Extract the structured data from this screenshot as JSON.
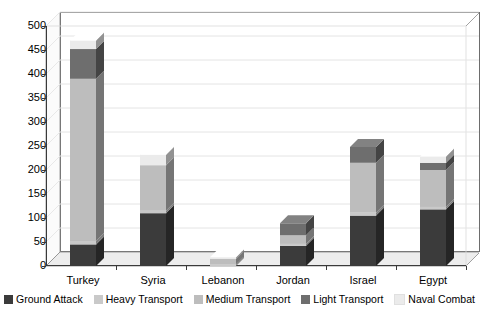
{
  "chart_data": {
    "type": "bar",
    "subtype": "stacked-3d-column",
    "title": "",
    "xlabel": "",
    "ylabel": "",
    "ylim": [
      0,
      500
    ],
    "ytick_labels": [
      "0",
      "50",
      "100",
      "150",
      "200",
      "250",
      "300",
      "350",
      "400",
      "450",
      "500"
    ],
    "ytick_values": [
      0,
      50,
      100,
      150,
      200,
      250,
      300,
      350,
      400,
      450,
      500
    ],
    "grid": true,
    "legend_position": "bottom",
    "categories": [
      "Turkey",
      "Syria",
      "Lebanon",
      "Jordan",
      "Israel",
      "Egypt"
    ],
    "series": [
      {
        "name": "Ground Attack",
        "color": "#3b3b3b",
        "values": [
          45,
          110,
          0,
          42,
          105,
          118
        ]
      },
      {
        "name": "Heavy Transport",
        "color": "#c9c9c9",
        "values": [
          7,
          5,
          3,
          4,
          6,
          5
        ]
      },
      {
        "name": "Medium Transport",
        "color": "#bdbdbd",
        "values": [
          338,
          95,
          12,
          18,
          104,
          77
        ]
      },
      {
        "name": "Light Transport",
        "color": "#6e6e6e",
        "values": [
          62,
          0,
          0,
          25,
          33,
          15
        ]
      },
      {
        "name": "Naval Combat",
        "color": "#ebebeb",
        "values": [
          18,
          22,
          3,
          0,
          0,
          13
        ]
      }
    ],
    "totals": [
      470,
      232,
      18,
      89,
      248,
      228
    ]
  },
  "legend": {
    "items": [
      {
        "label": "Ground Attack",
        "color": "#3b3b3b"
      },
      {
        "label": "Heavy Transport",
        "color": "#c9c9c9"
      },
      {
        "label": "Medium Transport",
        "color": "#bdbdbd"
      },
      {
        "label": "Light Transport",
        "color": "#6e6e6e"
      },
      {
        "label": "Naval Combat",
        "color": "#ebebeb"
      }
    ]
  },
  "axes": {
    "y": {
      "ticks": [
        "500",
        "450",
        "400",
        "350",
        "300",
        "250",
        "200",
        "150",
        "100",
        "50",
        "0"
      ]
    },
    "x": {
      "ticks": [
        "Turkey",
        "Syria",
        "Lebanon",
        "Jordan",
        "Israel",
        "Egypt"
      ]
    }
  },
  "colors": {
    "plot_border": "#6d6d6d",
    "axis": "#3a3a3a",
    "gridline": "#e4e4e4",
    "floor": "#ededed",
    "wall": "#f4f4f4",
    "background": "#ffffff"
  }
}
